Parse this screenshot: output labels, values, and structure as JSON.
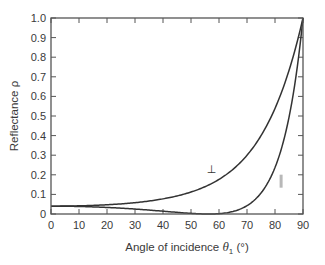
{
  "chart_data": {
    "type": "line",
    "title": "",
    "xlabel": "Angle of incidence θ1 (°)",
    "ylabel": "Reflectance ρ",
    "xlim": [
      0,
      90
    ],
    "ylim": [
      0,
      1.0
    ],
    "xticks": [
      0,
      10,
      20,
      30,
      40,
      50,
      60,
      70,
      80,
      90
    ],
    "yticks": [
      0,
      0.1,
      0.2,
      0.3,
      0.4,
      0.5,
      0.6,
      0.7,
      0.8,
      0.9,
      1.0
    ],
    "xtick_labels": [
      "0",
      "10",
      "20",
      "30",
      "40",
      "50",
      "60",
      "70",
      "80",
      "90"
    ],
    "ytick_labels": [
      "0",
      "0.1",
      "0.2",
      "0.3",
      "0.4",
      "0.5",
      "0.6",
      "0.7",
      "0.8",
      "0.9",
      "1.0"
    ],
    "grid": false,
    "legend": "inline curve labels",
    "series": [
      {
        "name": "⊥",
        "x": [
          0,
          10,
          20,
          30,
          40,
          50,
          55,
          60,
          65,
          70,
          75,
          80,
          85,
          90
        ],
        "values": [
          0.04,
          0.041,
          0.045,
          0.058,
          0.08,
          0.125,
          0.159,
          0.2,
          0.267,
          0.352,
          0.461,
          0.604,
          0.78,
          1.0
        ]
      },
      {
        "name": "∥",
        "x": [
          0,
          10,
          20,
          30,
          40,
          50,
          56.3,
          60,
          65,
          70,
          75,
          80,
          85,
          90
        ],
        "values": [
          0.04,
          0.039,
          0.034,
          0.025,
          0.015,
          0.003,
          0.0,
          0.002,
          0.017,
          0.042,
          0.106,
          0.252,
          0.51,
          1.0
        ]
      }
    ],
    "annotations": [
      {
        "text": "⊥",
        "x": 57,
        "y": 0.23
      },
      {
        "text": "∥",
        "x": 82,
        "y": 0.17
      }
    ]
  },
  "labels": {
    "xlabel_prefix": "Angle of incidence ",
    "xlabel_theta": "θ",
    "xlabel_sub": "1",
    "xlabel_suffix": " (°)",
    "ylabel": "Reflectance ρ",
    "perp": "⊥",
    "par": "∥"
  },
  "colors": {
    "axis": "#555555",
    "curve": "#333333",
    "par_label": "#b8b8b8",
    "text": "#3a3a3a"
  }
}
